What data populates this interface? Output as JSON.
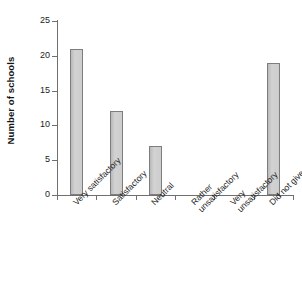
{
  "chart_data": {
    "type": "bar",
    "title": "",
    "subtitle": "",
    "xlabel": "",
    "ylabel": "Number of schools",
    "categories": [
      "Very satisfactory",
      "Satisfactory",
      "Neutral",
      "Rather unsatisfactory",
      "Very unsatisfactory",
      "Did not give rating"
    ],
    "category_lines": [
      [
        "Very satisfactory"
      ],
      [
        "Satisfactory"
      ],
      [
        "Neutral"
      ],
      [
        "Rather",
        "unsatisfactory"
      ],
      [
        "Very",
        "unsatisfactory"
      ],
      [
        "Did not give rating"
      ]
    ],
    "values": [
      21,
      12,
      7,
      0,
      0,
      19
    ],
    "ylim": [
      0,
      25
    ],
    "yticks": [
      0,
      5,
      10,
      15,
      20,
      25
    ],
    "ytick_labels": [
      "0",
      "5",
      "10",
      "15",
      "20",
      "25"
    ],
    "grid": false,
    "legend": false,
    "bar_fill_color": "#c9c9c9",
    "bar_border_color": "#7d7d7d",
    "axis_color": "#6f6f6f"
  }
}
